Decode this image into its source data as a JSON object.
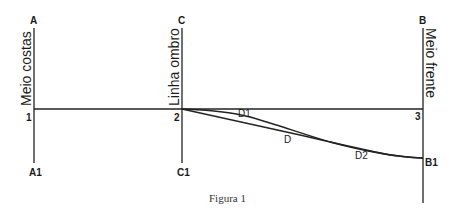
{
  "figure": {
    "caption": "Figura 1",
    "labels": {
      "A": "A",
      "A1": "A1",
      "C": "C",
      "C1": "C1",
      "B": "B",
      "B1": "B1",
      "p1": "1",
      "p2": "2",
      "p3": "3",
      "D": "D",
      "D1": "D1",
      "D2": "D2"
    },
    "vertical_captions": {
      "left": "Meio costas",
      "middle": "Linha ombro",
      "right": "Meio frente"
    },
    "colors": {
      "line": "#222222",
      "text": "#1a1a1a",
      "background": "#ffffff"
    }
  }
}
